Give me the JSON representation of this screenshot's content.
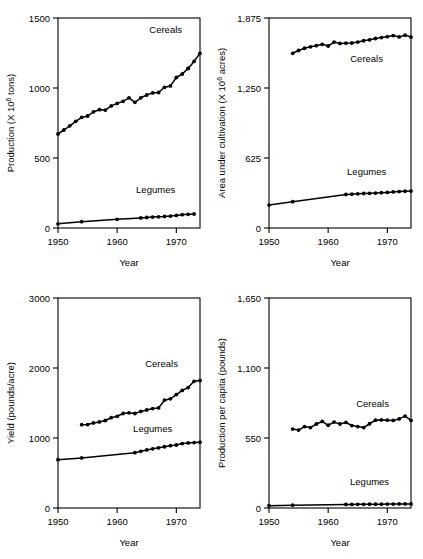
{
  "figure": {
    "title": "",
    "panel_count": 4
  },
  "chart_data": [
    {
      "id": "production",
      "type": "line",
      "title": "",
      "xlabel": "Year",
      "ylabel": "Production (X 10⁶ tons)",
      "ylabel_prefix": "Production (X 10",
      "ylabel_exp": "6",
      "ylabel_suffix": " tons)",
      "xlim": [
        1950,
        1974
      ],
      "ylim": [
        0,
        1500
      ],
      "xticks": [
        1950,
        1960,
        1970
      ],
      "xticklabels": [
        "1950",
        "1960",
        "1970"
      ],
      "yticks": [
        0,
        500,
        1000,
        1500
      ],
      "yticklabels": [
        "0",
        "500",
        "1000",
        "1500"
      ],
      "grid": false,
      "legend_position": "inline",
      "series": [
        {
          "name": "Cereals",
          "label_x": 1968.2,
          "label_y": 1390,
          "x": [
            1950,
            1951,
            1952,
            1953,
            1954,
            1955,
            1956,
            1957,
            1958,
            1959,
            1960,
            1961,
            1962,
            1963,
            1964,
            1965,
            1966,
            1967,
            1968,
            1969,
            1970,
            1971,
            1972
          ],
          "values": [
            672,
            700,
            730,
            762,
            790,
            800,
            830,
            845,
            842,
            872,
            890,
            905,
            930,
            898,
            930,
            950,
            965,
            968,
            1005,
            1015,
            1075,
            1100,
            1140
          ]
        },
        {
          "name": "Cereals-tail",
          "hidden": true,
          "x": [
            1972,
            1973,
            1974
          ],
          "values": [
            1140,
            1190,
            1248
          ]
        },
        {
          "name": "Legumes",
          "label_x": 1966.5,
          "label_y": 250,
          "x": [
            1950,
            1954,
            1960,
            1964,
            1965,
            1966,
            1967,
            1968,
            1969,
            1970,
            1971,
            1972,
            1973
          ],
          "values": [
            30,
            45,
            62,
            72,
            75,
            78,
            80,
            82,
            85,
            90,
            95,
            98,
            100
          ]
        }
      ]
    },
    {
      "id": "area",
      "type": "line",
      "title": "",
      "xlabel": "Year",
      "ylabel": "Area under cultivation (X 10⁶ acres)",
      "ylabel_prefix": "Area under cultivation (X 10",
      "ylabel_exp": "6",
      "ylabel_suffix": " acres)",
      "xlim": [
        1950,
        1974
      ],
      "ylim": [
        0,
        1875
      ],
      "xticks": [
        1950,
        1960,
        1970
      ],
      "xticklabels": [
        "1950",
        "1960",
        "1970"
      ],
      "yticks": [
        0,
        625,
        1250,
        1875
      ],
      "yticklabels": [
        "0",
        "625",
        "1,250",
        "1,875"
      ],
      "grid": false,
      "legend_position": "inline",
      "series": [
        {
          "name": "Cereals",
          "label_x": 1966.5,
          "label_y": 1480,
          "x": [
            1954,
            1955,
            1956,
            1957,
            1958,
            1959,
            1960,
            1961,
            1962,
            1963,
            1964,
            1965,
            1966,
            1967,
            1968,
            1969,
            1970,
            1971,
            1972,
            1973,
            1974
          ],
          "values": [
            1560,
            1585,
            1605,
            1618,
            1628,
            1640,
            1625,
            1660,
            1648,
            1650,
            1652,
            1660,
            1672,
            1680,
            1692,
            1700,
            1708,
            1718,
            1706,
            1722,
            1705
          ]
        },
        {
          "name": "Legumes",
          "label_x": 1966.5,
          "label_y": 470,
          "x": [
            1950,
            1954,
            1963,
            1964,
            1965,
            1966,
            1967,
            1968,
            1969,
            1970,
            1971,
            1972,
            1973,
            1974
          ],
          "values": [
            205,
            235,
            300,
            302,
            305,
            308,
            310,
            312,
            315,
            318,
            322,
            325,
            328,
            330
          ]
        }
      ]
    },
    {
      "id": "yield",
      "type": "line",
      "title": "",
      "xlabel": "Year",
      "ylabel": "Yield (pounds/acre)",
      "ylabel_prefix": "Yield (pounds/acre)",
      "ylabel_exp": "",
      "ylabel_suffix": "",
      "xlim": [
        1950,
        1974
      ],
      "ylim": [
        0,
        3000
      ],
      "xticks": [
        1950,
        1960,
        1970
      ],
      "xticklabels": [
        "1950",
        "1960",
        "1970"
      ],
      "yticks": [
        0,
        1000,
        2000,
        3000
      ],
      "yticklabels": [
        "0",
        "1000",
        "2000",
        "3000"
      ],
      "grid": false,
      "legend_position": "inline",
      "series": [
        {
          "name": "Cereals",
          "label_x": 1967.5,
          "label_y": 2020,
          "x": [
            1954,
            1955,
            1956,
            1957,
            1958,
            1959,
            1960,
            1961,
            1962,
            1963,
            1964,
            1965,
            1966,
            1967,
            1968,
            1969,
            1970,
            1971,
            1972,
            1973,
            1974
          ],
          "values": [
            1190,
            1192,
            1215,
            1230,
            1250,
            1290,
            1310,
            1350,
            1360,
            1350,
            1380,
            1400,
            1420,
            1430,
            1540,
            1560,
            1620,
            1680,
            1720,
            1810,
            1820
          ]
        },
        {
          "name": "Legumes",
          "label_x": 1966.0,
          "label_y": 1080,
          "x": [
            1950,
            1954,
            1963,
            1964,
            1965,
            1966,
            1967,
            1968,
            1969,
            1970,
            1971,
            1972,
            1973,
            1974
          ],
          "values": [
            690,
            715,
            790,
            810,
            830,
            845,
            860,
            875,
            890,
            900,
            920,
            930,
            935,
            940
          ]
        }
      ]
    },
    {
      "id": "per-capita",
      "type": "line",
      "title": "",
      "xlabel": "Year",
      "ylabel": "Production per capita (pounds)",
      "ylabel_prefix": "Production per capita (pounds)",
      "ylabel_exp": "",
      "ylabel_suffix": "",
      "xlim": [
        1950,
        1974
      ],
      "ylim": [
        0,
        1650
      ],
      "xticks": [
        1950,
        1960,
        1970
      ],
      "xticklabels": [
        "1950",
        "1960",
        "1970"
      ],
      "yticks": [
        0,
        550,
        1100,
        1650
      ],
      "yticklabels": [
        "0",
        "550",
        "1,100",
        "1,650"
      ],
      "grid": false,
      "legend_position": "inline",
      "series": [
        {
          "name": "Cereals",
          "label_x": 1967.5,
          "label_y": 790,
          "x": [
            1954,
            1955,
            1956,
            1957,
            1958,
            1959,
            1960,
            1961,
            1962,
            1963,
            1964,
            1965,
            1966,
            1967,
            1968,
            1969,
            1970,
            1971,
            1972,
            1973,
            1974
          ],
          "values": [
            620,
            612,
            640,
            632,
            660,
            680,
            650,
            675,
            660,
            672,
            648,
            640,
            632,
            662,
            690,
            692,
            690,
            688,
            700,
            722,
            688
          ]
        },
        {
          "name": "Legumes",
          "label_x": 1967.0,
          "label_y": 180,
          "x": [
            1950,
            1954,
            1963,
            1964,
            1965,
            1966,
            1967,
            1968,
            1969,
            1970,
            1971,
            1972,
            1973,
            1974
          ],
          "values": [
            18,
            22,
            28,
            28,
            29,
            29,
            30,
            30,
            30,
            31,
            31,
            32,
            32,
            32
          ]
        }
      ]
    }
  ]
}
